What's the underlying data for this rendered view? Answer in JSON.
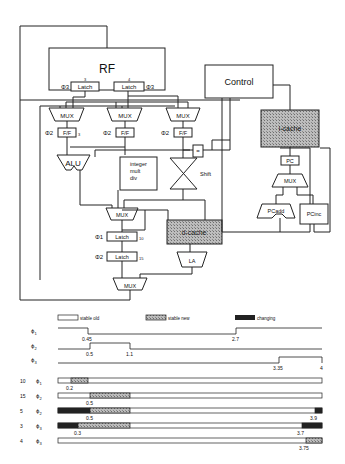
{
  "diagram": {
    "blocks": {
      "rf": "RF",
      "control": "Control",
      "latch_left": "Latch",
      "latch_right": "Latch",
      "latch_left_num": "3",
      "latch_right_num": "4",
      "phi3_left": "Φ3",
      "phi3_right": "Φ3",
      "mux1": "MUX",
      "mux2": "MUX",
      "mux3": "MUX",
      "ff1": "F/F",
      "ff2": "F/F",
      "ff3": "F/F",
      "ff1_num": "3",
      "phi2_a": "Φ2",
      "phi2_b": "Φ2",
      "phi2_c": "Φ2",
      "alu": "ALU",
      "intmult_l1": "integer",
      "intmult_l2": "mult",
      "intmult_l3": "div",
      "shift": "Shift",
      "eq": "=",
      "icache": "i-cache",
      "pc": "PC",
      "pcmux": "MUX",
      "pcadd": "PCadd",
      "pcinc": "PCinc",
      "mux_wb": "MUX",
      "dcache": "d-cache",
      "la": "LA",
      "latch_b1": "Latch",
      "latch_b2": "Latch",
      "latch_b1_num": "10",
      "latch_b2_num": "15",
      "phi1_b": "Φ1",
      "phi2_bb": "Φ2",
      "mux_final": "MUX"
    },
    "legend": {
      "stable_old": "stable old",
      "stable_new": "stable new",
      "changing": "changing"
    },
    "clocks": [
      {
        "label": "ϕ1",
        "sub": "1",
        "edges": [
          "0.45",
          "2.7"
        ]
      },
      {
        "label": "ϕ2",
        "sub": "2",
        "edges": [
          "0.5",
          "1.1"
        ]
      },
      {
        "label": "ϕ3",
        "sub": "3",
        "edges": [
          "3.35",
          "4"
        ]
      }
    ],
    "bars": [
      {
        "num": "10",
        "phase": "1",
        "marks": [
          "0.2"
        ],
        "end": ""
      },
      {
        "num": "15",
        "phase": "2",
        "marks": [
          "0.5"
        ],
        "end": ""
      },
      {
        "num": "5",
        "phase": "2",
        "marks": [
          "0.5"
        ],
        "end": "3.9"
      },
      {
        "num": "3",
        "phase": "3",
        "marks": [
          "0.3"
        ],
        "end": "3.7"
      },
      {
        "num": "4",
        "phase": "3",
        "marks": [],
        "end": "3.75"
      }
    ]
  }
}
